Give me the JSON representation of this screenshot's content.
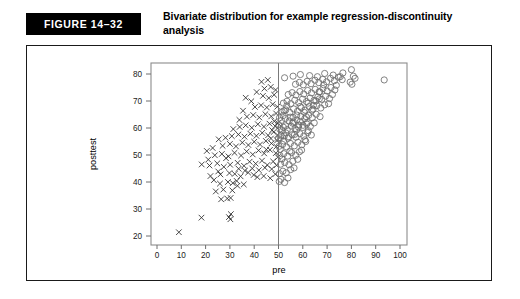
{
  "figure": {
    "tag": "FIGURE 14–32",
    "caption": "Bivariate distribution for example regression-discontinuity analysis"
  },
  "colors": {
    "tag_bg": "#000000",
    "tag_fg": "#ffffff",
    "panel_border": "#1a1a1a",
    "frame": "#8c8c8c",
    "cross": "#2b2b2b",
    "circle": "#6b6b6b",
    "cutoff": "#7a7a7a"
  },
  "chart_data": {
    "type": "scatter",
    "title": "Bivariate distribution for example regression-discontinuity analysis",
    "xlabel": "pre",
    "ylabel": "posttest",
    "xlim": [
      0,
      100
    ],
    "ylim": [
      18,
      84
    ],
    "xticks": [
      0,
      10,
      20,
      30,
      40,
      50,
      60,
      70,
      80,
      90,
      100
    ],
    "yticks": [
      20,
      30,
      40,
      50,
      60,
      70,
      80
    ],
    "grid": false,
    "legend": "none",
    "annotations": [
      {
        "type": "vline",
        "x": 50,
        "label": "cutoff"
      }
    ],
    "series": [
      {
        "name": "below-cutoff",
        "marker": "x",
        "color": "#2b2b2b",
        "points": [
          [
            9.0,
            21.4
          ],
          [
            18.3,
            26.8
          ],
          [
            29.6,
            27.0
          ],
          [
            30.2,
            26.2
          ],
          [
            30.4,
            28.1
          ],
          [
            26.4,
            33.6
          ],
          [
            28.9,
            33.9
          ],
          [
            30.3,
            34.1
          ],
          [
            24.2,
            36.5
          ],
          [
            27.3,
            37.2
          ],
          [
            31.0,
            36.9
          ],
          [
            33.1,
            38.6
          ],
          [
            25.9,
            39.4
          ],
          [
            29.2,
            40.0
          ],
          [
            32.8,
            40.4
          ],
          [
            35.7,
            39.1
          ],
          [
            22.0,
            42.2
          ],
          [
            26.1,
            42.8
          ],
          [
            29.8,
            43.3
          ],
          [
            32.0,
            43.0
          ],
          [
            34.4,
            42.1
          ],
          [
            37.5,
            43.5
          ],
          [
            39.8,
            42.6
          ],
          [
            41.3,
            41.8
          ],
          [
            43.9,
            42.2
          ],
          [
            46.6,
            41.4
          ],
          [
            48.7,
            42.9
          ],
          [
            18.4,
            46.5
          ],
          [
            21.6,
            46.1
          ],
          [
            24.8,
            46.9
          ],
          [
            27.5,
            45.6
          ],
          [
            30.1,
            46.4
          ],
          [
            33.2,
            47.1
          ],
          [
            35.8,
            46.0
          ],
          [
            38.1,
            47.5
          ],
          [
            40.6,
            46.8
          ],
          [
            43.2,
            47.9
          ],
          [
            45.4,
            46.3
          ],
          [
            47.8,
            47.6
          ],
          [
            49.2,
            46.2
          ],
          [
            23.8,
            49.9
          ],
          [
            26.7,
            50.4
          ],
          [
            29.4,
            49.5
          ],
          [
            31.9,
            50.8
          ],
          [
            34.6,
            49.8
          ],
          [
            36.9,
            51.3
          ],
          [
            39.4,
            50.2
          ],
          [
            41.8,
            51.7
          ],
          [
            44.1,
            50.6
          ],
          [
            46.5,
            51.9
          ],
          [
            48.9,
            50.7
          ],
          [
            27.0,
            53.4
          ],
          [
            30.0,
            54.1
          ],
          [
            32.5,
            53.2
          ],
          [
            35.1,
            54.6
          ],
          [
            37.6,
            53.7
          ],
          [
            40.0,
            54.9
          ],
          [
            42.4,
            53.9
          ],
          [
            44.8,
            55.2
          ],
          [
            47.1,
            54.3
          ],
          [
            49.4,
            55.4
          ],
          [
            30.8,
            57.0
          ],
          [
            33.5,
            57.6
          ],
          [
            36.0,
            56.8
          ],
          [
            38.4,
            57.9
          ],
          [
            40.9,
            57.1
          ],
          [
            43.3,
            58.2
          ],
          [
            45.7,
            57.3
          ],
          [
            48.0,
            58.5
          ],
          [
            49.6,
            57.4
          ],
          [
            34.0,
            60.4
          ],
          [
            36.5,
            61.0
          ],
          [
            39.0,
            60.1
          ],
          [
            41.5,
            61.4
          ],
          [
            44.0,
            60.5
          ],
          [
            46.3,
            61.6
          ],
          [
            48.6,
            60.7
          ],
          [
            49.8,
            61.8
          ],
          [
            37.0,
            64.2
          ],
          [
            39.6,
            64.8
          ],
          [
            42.1,
            63.9
          ],
          [
            44.6,
            65.1
          ],
          [
            47.0,
            64.3
          ],
          [
            49.0,
            65.4
          ],
          [
            40.3,
            67.8
          ],
          [
            42.8,
            68.4
          ],
          [
            45.2,
            67.6
          ],
          [
            47.6,
            68.8
          ],
          [
            49.5,
            67.9
          ],
          [
            36.5,
            71.2
          ],
          [
            43.6,
            71.9
          ],
          [
            46.0,
            71.1
          ],
          [
            48.2,
            72.3
          ],
          [
            44.2,
            74.6
          ],
          [
            46.8,
            75.2
          ],
          [
            48.8,
            74.1
          ],
          [
            43.0,
            77.1
          ],
          [
            45.6,
            77.8
          ],
          [
            20.5,
            51.5
          ],
          [
            22.9,
            52.6
          ],
          [
            25.4,
            55.8
          ],
          [
            28.2,
            56.4
          ],
          [
            31.4,
            59.6
          ],
          [
            33.9,
            63.0
          ],
          [
            35.4,
            66.4
          ],
          [
            38.8,
            69.9
          ],
          [
            41.0,
            73.3
          ],
          [
            45.0,
            52.0
          ],
          [
            46.9,
            56.1
          ],
          [
            47.4,
            59.2
          ],
          [
            48.3,
            62.5
          ],
          [
            49.1,
            53.1
          ],
          [
            49.7,
            49.2
          ],
          [
            47.2,
            44.8
          ],
          [
            44.4,
            45.3
          ],
          [
            41.9,
            44.4
          ],
          [
            39.2,
            45.0
          ],
          [
            36.2,
            44.2
          ],
          [
            33.6,
            44.9
          ],
          [
            31.2,
            39.6
          ],
          [
            28.4,
            48.8
          ],
          [
            25.2,
            43.9
          ],
          [
            23.4,
            40.7
          ],
          [
            21.1,
            48.3
          ]
        ]
      },
      {
        "name": "above-cutoff",
        "marker": "o",
        "color": "#6b6b6b",
        "points": [
          [
            50.4,
            43.1
          ],
          [
            51.8,
            44.0
          ],
          [
            53.2,
            43.4
          ],
          [
            50.9,
            46.6
          ],
          [
            52.6,
            47.2
          ],
          [
            54.3,
            46.4
          ],
          [
            55.9,
            47.7
          ],
          [
            50.6,
            49.8
          ],
          [
            52.2,
            50.5
          ],
          [
            53.8,
            49.6
          ],
          [
            55.4,
            50.9
          ],
          [
            57.1,
            49.9
          ],
          [
            58.6,
            51.2
          ],
          [
            50.2,
            53.2
          ],
          [
            51.7,
            53.9
          ],
          [
            53.3,
            53.0
          ],
          [
            54.9,
            54.3
          ],
          [
            56.5,
            53.4
          ],
          [
            58.0,
            54.7
          ],
          [
            59.6,
            53.8
          ],
          [
            61.2,
            55.0
          ],
          [
            50.8,
            56.4
          ],
          [
            52.4,
            57.1
          ],
          [
            54.0,
            56.2
          ],
          [
            55.6,
            57.5
          ],
          [
            57.2,
            56.6
          ],
          [
            58.8,
            57.9
          ],
          [
            60.4,
            57.0
          ],
          [
            62.0,
            58.3
          ],
          [
            63.5,
            57.4
          ],
          [
            50.5,
            59.6
          ],
          [
            52.0,
            60.3
          ],
          [
            53.6,
            59.4
          ],
          [
            55.2,
            60.7
          ],
          [
            56.8,
            59.8
          ],
          [
            58.4,
            61.1
          ],
          [
            60.0,
            60.2
          ],
          [
            61.6,
            61.5
          ],
          [
            63.1,
            60.6
          ],
          [
            64.7,
            61.9
          ],
          [
            51.2,
            62.8
          ],
          [
            52.8,
            63.5
          ],
          [
            54.4,
            62.6
          ],
          [
            56.0,
            63.9
          ],
          [
            57.6,
            63.0
          ],
          [
            59.2,
            64.3
          ],
          [
            60.8,
            63.4
          ],
          [
            62.4,
            64.7
          ],
          [
            63.9,
            63.8
          ],
          [
            65.5,
            65.1
          ],
          [
            67.1,
            64.2
          ],
          [
            51.5,
            66.0
          ],
          [
            53.0,
            66.7
          ],
          [
            54.6,
            65.8
          ],
          [
            56.2,
            67.1
          ],
          [
            57.8,
            66.2
          ],
          [
            59.4,
            67.5
          ],
          [
            61.0,
            66.6
          ],
          [
            62.6,
            67.9
          ],
          [
            64.2,
            67.0
          ],
          [
            65.8,
            68.3
          ],
          [
            67.4,
            67.4
          ],
          [
            69.0,
            68.6
          ],
          [
            52.0,
            69.2
          ],
          [
            53.5,
            69.9
          ],
          [
            55.1,
            69.0
          ],
          [
            56.7,
            70.3
          ],
          [
            58.3,
            69.4
          ],
          [
            59.9,
            70.7
          ],
          [
            61.5,
            69.8
          ],
          [
            63.0,
            71.1
          ],
          [
            64.6,
            70.2
          ],
          [
            66.2,
            71.5
          ],
          [
            67.8,
            70.6
          ],
          [
            69.4,
            71.8
          ],
          [
            71.0,
            70.9
          ],
          [
            54.0,
            72.4
          ],
          [
            55.6,
            73.1
          ],
          [
            57.2,
            72.2
          ],
          [
            58.8,
            73.5
          ],
          [
            60.4,
            72.6
          ],
          [
            62.0,
            73.9
          ],
          [
            63.6,
            73.0
          ],
          [
            65.1,
            74.3
          ],
          [
            66.7,
            73.4
          ],
          [
            68.3,
            74.6
          ],
          [
            70.0,
            73.7
          ],
          [
            71.6,
            75.0
          ],
          [
            73.2,
            74.1
          ],
          [
            57.0,
            76.2
          ],
          [
            58.6,
            76.9
          ],
          [
            60.2,
            76.0
          ],
          [
            61.8,
            77.3
          ],
          [
            63.4,
            76.4
          ],
          [
            65.0,
            77.7
          ],
          [
            66.6,
            76.8
          ],
          [
            68.2,
            78.0
          ],
          [
            69.8,
            77.1
          ],
          [
            71.4,
            78.4
          ],
          [
            73.0,
            77.5
          ],
          [
            74.6,
            78.8
          ],
          [
            76.2,
            77.9
          ],
          [
            52.5,
            78.6
          ],
          [
            56.0,
            79.2
          ],
          [
            59.0,
            79.8
          ],
          [
            62.8,
            79.4
          ],
          [
            66.0,
            79.0
          ],
          [
            69.0,
            80.2
          ],
          [
            72.5,
            79.6
          ],
          [
            76.5,
            80.4
          ],
          [
            80.0,
            81.6
          ],
          [
            80.8,
            79.2
          ],
          [
            81.5,
            78.4
          ],
          [
            93.5,
            77.8
          ],
          [
            79.5,
            77.0
          ],
          [
            80.2,
            76.2
          ],
          [
            50.3,
            40.2
          ],
          [
            51.0,
            41.0
          ],
          [
            52.5,
            39.8
          ],
          [
            53.9,
            41.5
          ],
          [
            55.0,
            44.6
          ],
          [
            56.4,
            45.2
          ],
          [
            57.9,
            48.4
          ],
          [
            59.5,
            51.8
          ],
          [
            60.9,
            55.6
          ],
          [
            62.3,
            59.0
          ],
          [
            50.7,
            52.1
          ],
          [
            51.4,
            48.5
          ],
          [
            52.1,
            55.2
          ],
          [
            53.0,
            58.2
          ],
          [
            54.7,
            51.4
          ],
          [
            51.1,
            57.3
          ],
          [
            50.1,
            61.2
          ],
          [
            51.9,
            64.6
          ],
          [
            53.4,
            68.2
          ],
          [
            55.8,
            61.8
          ],
          [
            57.4,
            59.2
          ],
          [
            59.0,
            62.4
          ],
          [
            60.6,
            65.8
          ],
          [
            62.2,
            69.2
          ],
          [
            63.8,
            66.6
          ],
          [
            65.4,
            70.0
          ],
          [
            67.0,
            73.4
          ],
          [
            68.6,
            76.0
          ],
          [
            70.6,
            69.0
          ],
          [
            72.2,
            72.4
          ],
          [
            73.8,
            75.8
          ],
          [
            75.4,
            79.0
          ],
          [
            66.8,
            70.8
          ],
          [
            64.4,
            68.4
          ],
          [
            61.4,
            64.2
          ],
          [
            58.2,
            60.4
          ],
          [
            56.6,
            57.6
          ],
          [
            54.2,
            56.8
          ],
          [
            52.9,
            60.8
          ],
          [
            51.6,
            59.0
          ],
          [
            50.0,
            56.0
          ],
          [
            50.4,
            63.8
          ],
          [
            52.3,
            66.4
          ],
          [
            54.8,
            64.0
          ],
          [
            56.1,
            62.2
          ],
          [
            57.5,
            64.8
          ],
          [
            58.9,
            68.0
          ],
          [
            60.1,
            61.0
          ],
          [
            61.9,
            62.0
          ]
        ]
      }
    ]
  }
}
